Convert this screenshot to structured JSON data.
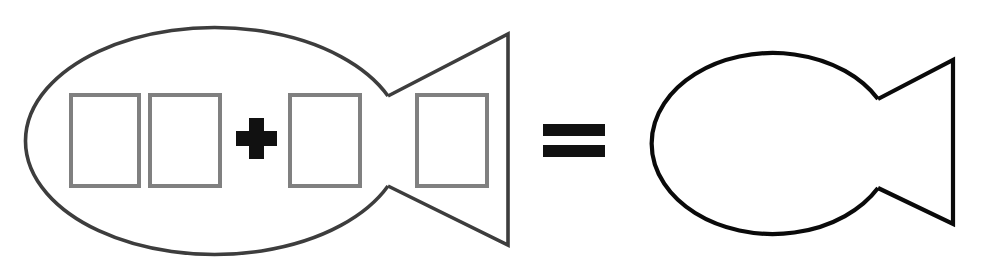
{
  "figure": {
    "background_color": "#ffffff",
    "width": 986,
    "height": 262
  },
  "palette": {
    "left_fish_stroke": "#3d3d3d",
    "right_fish_stroke": "#0a0a0a",
    "slot_stroke": "#808080",
    "operator_fill": "#111111",
    "background": "#ffffff"
  },
  "equation": {
    "expression": "fish + fish = fish",
    "operators": [
      {
        "name": "plus-operator",
        "symbol": "+"
      },
      {
        "name": "equals-operator",
        "symbol": "="
      }
    ]
  },
  "left_fish": {
    "label": "left fish outline",
    "stroke_color": "#3d3d3d",
    "stroke_width": 3.6,
    "body": {
      "shape": "ellipse",
      "cx": 219,
      "cy": 129.5,
      "rx": 189,
      "ry": 113.5
    },
    "tail": {
      "shape": "notched-triangle",
      "notch_x": 388,
      "notch_top_y": 96,
      "notch_bottom_y": 186,
      "tip_x": 508,
      "tip_top_y": 34,
      "tip_bottom_y": 245
    },
    "slots": [
      {
        "name": "slot-1",
        "x": 71,
        "y": 95,
        "width": 68,
        "height": 91,
        "value": ""
      },
      {
        "name": "slot-2",
        "x": 150,
        "y": 95,
        "width": 70,
        "height": 91,
        "value": ""
      },
      {
        "name": "slot-3",
        "x": 290,
        "y": 95,
        "width": 70,
        "height": 91,
        "value": ""
      },
      {
        "name": "slot-4",
        "x": 417,
        "y": 95,
        "width": 70,
        "height": 91,
        "value": ""
      }
    ],
    "plus": {
      "name": "plus-operator",
      "symbol": "+",
      "cx": 256.5,
      "cy": 138.5,
      "arm_length": 41,
      "arm_thickness": 15
    }
  },
  "equals": {
    "name": "equals-operator",
    "symbol": "=",
    "bars": [
      {
        "x": 543,
        "y": 124,
        "width": 62,
        "height": 12
      },
      {
        "x": 543,
        "y": 145,
        "width": 62,
        "height": 12
      }
    ]
  },
  "right_fish": {
    "label": "right fish outline",
    "stroke_color": "#0a0a0a",
    "stroke_width": 4.2,
    "body": {
      "shape": "ellipse",
      "cx": 757,
      "cy": 137.5,
      "rx": 121,
      "ry": 90.5
    },
    "tail": {
      "shape": "notched-triangle",
      "notch_x": 878,
      "notch_top_y": 99,
      "notch_bottom_y": 188,
      "tip_x": 953,
      "tip_top_y": 60,
      "tip_bottom_y": 224
    }
  }
}
